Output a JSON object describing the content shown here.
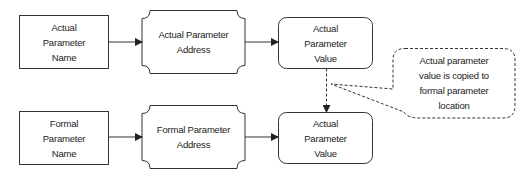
{
  "diagram": {
    "top_row": {
      "name_box": {
        "lines": [
          "Actual",
          "Parameter",
          "Name"
        ]
      },
      "address_box": {
        "lines": [
          "Actual Parameter",
          "Address"
        ]
      },
      "value_box": {
        "lines": [
          "Actual",
          "Parameter",
          "Value"
        ]
      }
    },
    "bottom_row": {
      "name_box": {
        "lines": [
          "Formal",
          "Parameter",
          "Name"
        ]
      },
      "address_box": {
        "lines": [
          "Formal Parameter",
          "Address"
        ]
      },
      "value_box": {
        "lines": [
          "Actual",
          "Parameter",
          "Value"
        ]
      }
    },
    "callout": {
      "lines": [
        "Actual parameter",
        "value is copied to",
        "formal parameter",
        "location"
      ]
    },
    "colors": {
      "stroke": "#333333",
      "text": "#222222",
      "background": "#ffffff"
    }
  }
}
